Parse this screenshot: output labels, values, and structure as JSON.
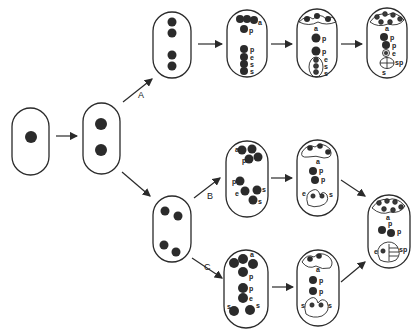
{
  "diagram": {
    "type": "developmental-sequence",
    "colors": {
      "outline": "#2a2a2a",
      "nucleus": "#2b2b2b",
      "background": "#ffffff"
    },
    "pathways": [
      {
        "label": "A"
      },
      {
        "label": "B"
      },
      {
        "label": "C"
      }
    ],
    "nucleus_labels": {
      "a": "a",
      "p": "p",
      "e": "e",
      "s": "s",
      "sp": "sp"
    },
    "stages": {
      "one_nucleate": {
        "nuclei": 1
      },
      "two_nucleate": {
        "nuclei": 2
      },
      "A_four_nucleate": {
        "nuclei": 4
      },
      "A_eight_nucleate": {
        "labels": [
          "a",
          "p",
          "p",
          "e",
          "s",
          "s"
        ]
      },
      "A_cellular": {
        "labels": [
          "a",
          "p",
          "p",
          "e",
          "s",
          "s"
        ]
      },
      "A_mature": {
        "labels": [
          "a",
          "p",
          "p",
          "e",
          "sp",
          "s"
        ]
      },
      "BC_four_nucleate": {
        "nuclei": 4
      },
      "B_eight_nucleate": {
        "labels": [
          "a",
          "p",
          "p",
          "e",
          "s",
          "s"
        ]
      },
      "B_cellular": {
        "labels": [
          "a",
          "p",
          "p",
          "e",
          "s"
        ]
      },
      "C_eight_nucleate": {
        "labels": [
          "a",
          "p",
          "p",
          "e",
          "s",
          "s"
        ]
      },
      "C_cellular": {
        "labels": [
          "a",
          "p",
          "p",
          "s",
          "s"
        ]
      },
      "BC_mature": {
        "labels": [
          "a",
          "p",
          "p",
          "e",
          "sp"
        ]
      }
    }
  }
}
